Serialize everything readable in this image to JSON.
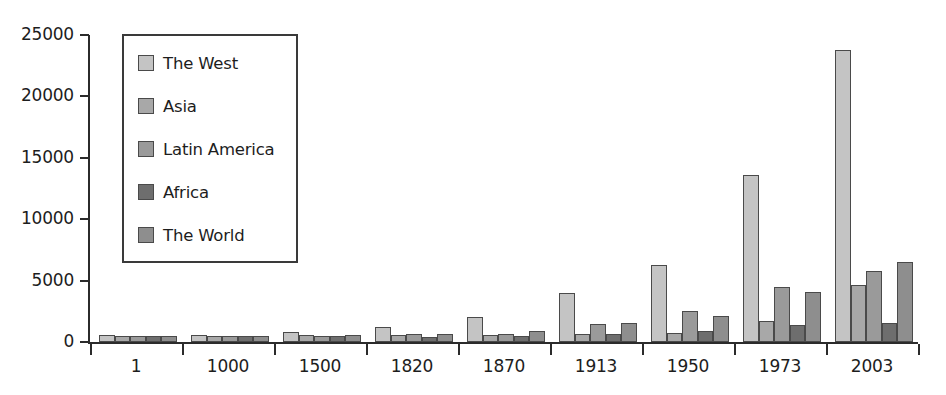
{
  "chart_data": {
    "type": "bar",
    "title": "",
    "xlabel": "",
    "ylabel": "",
    "grid": false,
    "legend_position": "top-left-inside",
    "categories": [
      "1",
      "1000",
      "1500",
      "1820",
      "1870",
      "1913",
      "1950",
      "1973",
      "2003"
    ],
    "ylim": [
      0,
      25000
    ],
    "yticks": [
      0,
      5000,
      10000,
      15000,
      20000,
      25000
    ],
    "ytick_labels": [
      "0",
      "5000",
      "10000",
      "15000",
      "20000",
      "25000"
    ],
    "series": [
      {
        "name": "The West",
        "color": "#c4c4c4",
        "values": [
          600,
          600,
          800,
          1200,
          2050,
          4000,
          6250,
          13600,
          23800
        ]
      },
      {
        "name": "Asia",
        "color": "#a8a8a8",
        "values": [
          450,
          450,
          550,
          580,
          540,
          660,
          720,
          1700,
          4650
        ]
      },
      {
        "name": "Latin America",
        "color": "#9a9a9a",
        "values": [
          450,
          450,
          500,
          690,
          690,
          1500,
          2500,
          4500,
          5800
        ]
      },
      {
        "name": "Africa",
        "color": "#6e6e6e",
        "values": [
          450,
          450,
          450,
          420,
          500,
          640,
          890,
          1400,
          1550
        ]
      },
      {
        "name": "The World",
        "color": "#8e8e8e",
        "values": [
          470,
          450,
          550,
          670,
          870,
          1520,
          2100,
          4100,
          6500
        ]
      }
    ]
  }
}
